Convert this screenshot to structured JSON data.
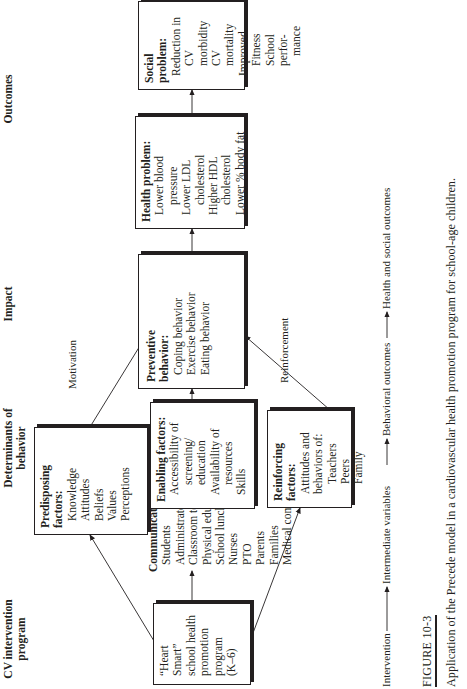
{
  "columns": {
    "cv_program": "CV intervention program",
    "determinants": "Determinants of behavior",
    "impact": "Impact",
    "outcomes": "Outcomes"
  },
  "boxes": {
    "heart_smart": {
      "lines": [
        "“Heart Smart”",
        "school health",
        "promotion",
        "program",
        "(K–6)"
      ]
    },
    "communications": {
      "title": "Communications:",
      "items": [
        "Students",
        "Administrators",
        "Classroom teachers",
        "Physical education",
        "School lunch",
        "Nurses",
        "PTO",
        "Parents",
        "Families",
        "Medical community"
      ]
    },
    "predisposing": {
      "title": "Predisposing factors:",
      "items": [
        "Knowledge",
        "Attitudes",
        "Beliefs",
        "Values",
        "Perceptions"
      ]
    },
    "enabling": {
      "title": "Enabling factors:",
      "items": [
        "Accessibility of",
        "screening/",
        "education",
        "Availability of",
        "resources",
        "Skills"
      ]
    },
    "reinforcing": {
      "title": "Reinforcing factors:",
      "items": [
        "Attitudes and",
        "behaviors of:",
        "Teachers",
        "Peers",
        "Family"
      ]
    },
    "preventive": {
      "title": "Preventive behavior:",
      "items": [
        "Coping behavior",
        "Exercise behavior",
        "Eating behavior"
      ]
    },
    "health": {
      "title": "Health problem:",
      "items": [
        "Lower blood",
        "pressure",
        "Lower LDL",
        "cholesterol",
        "Higher HDL",
        "cholesterol",
        "Lower % body fat"
      ]
    },
    "social": {
      "title": "Social problem:",
      "items": [
        "Reduction in",
        "CV morbidity",
        "CV mortality",
        "Improved",
        "Fitness",
        "School perfor-",
        "mance"
      ]
    }
  },
  "arrow_labels": {
    "motivation": "Motivation",
    "reinforcement": "Reinforcement"
  },
  "axis": {
    "intervention": "Intervention",
    "intermediate": "Intermediate variables",
    "behavioral": "Behavioral outcomes",
    "health_social": "Health and social outcomes"
  },
  "figure": {
    "label": "FIGURE 10-3",
    "caption": "Application of the Precede model in a cardiovascular health promotion program for school-age children."
  }
}
